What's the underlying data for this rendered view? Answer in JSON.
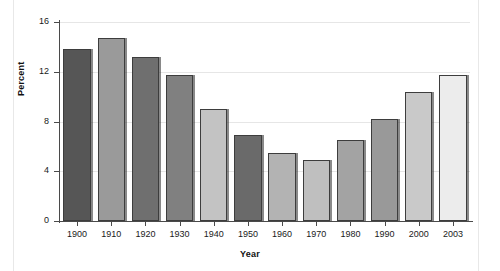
{
  "chart_data": {
    "type": "bar",
    "title": "",
    "subtitle": "",
    "xlabel": "Year",
    "ylabel": "Percent",
    "categories": [
      "1900",
      "1910",
      "1920",
      "1930",
      "1940",
      "1950",
      "1960",
      "1970",
      "1980",
      "1990",
      "2000",
      "2003"
    ],
    "values": [
      13.8,
      14.7,
      13.2,
      11.7,
      9.0,
      6.9,
      5.5,
      4.9,
      6.5,
      8.2,
      10.4,
      11.7
    ],
    "ylim": [
      0,
      16
    ],
    "yticks": [
      0,
      4,
      8,
      12,
      16
    ],
    "ytick_labels": [
      "0",
      "4",
      "8",
      "12",
      "16"
    ],
    "grid": true,
    "grid_axis": "y",
    "legend": "none",
    "bar_colors": [
      "#565656",
      "#9a9a9a",
      "#6f6f6f",
      "#808080",
      "#c3c3c3",
      "#6a6a6a",
      "#b3b3b3",
      "#bfbfbf",
      "#a3a3a3",
      "#999999",
      "#c9c9c9",
      "#ececec"
    ],
    "bar_edge_color": "#3d3d3d",
    "axis_color": "#4a4a4a",
    "grid_color": "#e6e6e6",
    "background_color": "#ffffff"
  }
}
